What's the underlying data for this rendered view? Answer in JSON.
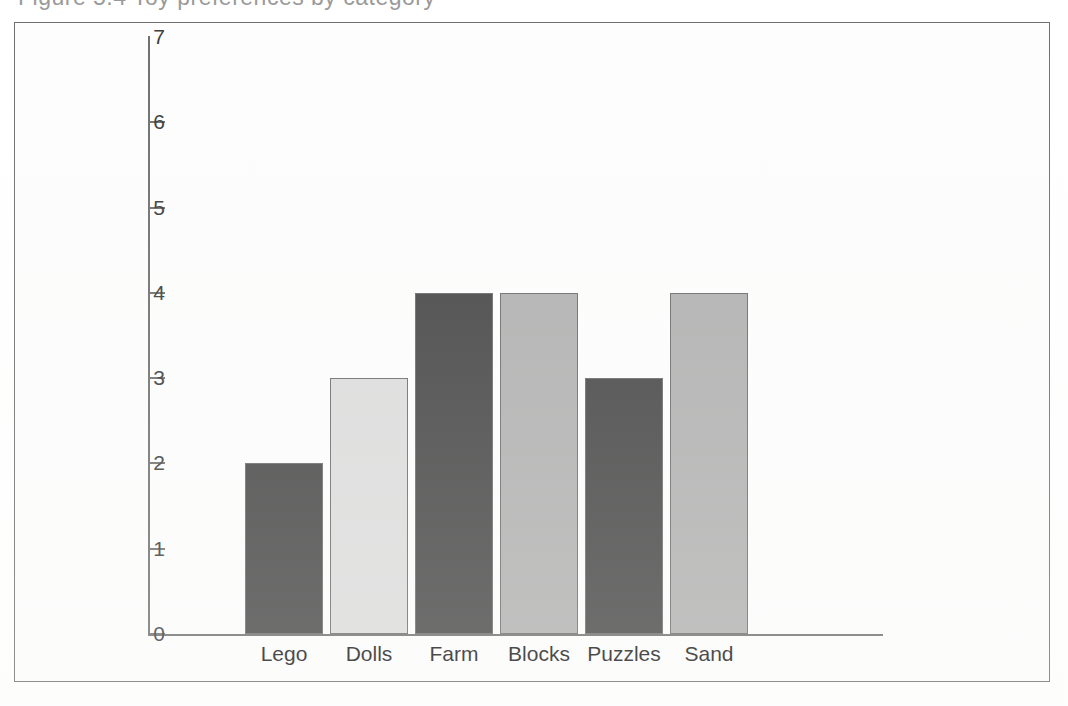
{
  "figure": {
    "caption_sliver": "Figure 5.4   Toy preferences by category",
    "frame_border_color": "#6e6e6e",
    "background_color": "#fdfdfd"
  },
  "chart_data": {
    "type": "bar",
    "title": "",
    "subtitle": "",
    "xlabel": "",
    "ylabel": "",
    "categories": [
      "Lego",
      "Dolls",
      "Farm",
      "Blocks",
      "Puzzles",
      "Sand"
    ],
    "values": [
      2,
      3,
      4,
      4,
      3,
      4
    ],
    "ylim": [
      0,
      7
    ],
    "yticks": [
      0,
      1,
      2,
      3,
      4,
      5,
      6,
      7
    ],
    "ytick_labels": [
      "0",
      "1",
      "2",
      "3",
      "4",
      "5",
      "6",
      "7"
    ],
    "grid": false,
    "legend": null,
    "legend_position": "none",
    "bar_colors": [
      "#454545",
      "#dcdcdc",
      "#454545",
      "#b0b0b0",
      "#454545",
      "#b0b0b0"
    ],
    "bar_border_color": "#6b6b6b",
    "axis_color": "#6f6f6f",
    "series": [
      {
        "name": "Number of children",
        "values": [
          2,
          3,
          4,
          4,
          3,
          4
        ]
      }
    ],
    "annotations": []
  }
}
